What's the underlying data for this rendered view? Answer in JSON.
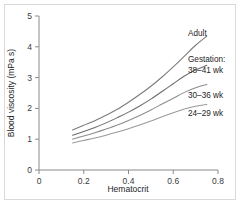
{
  "chart_data": {
    "type": "line",
    "title": "",
    "xlabel": "Hematocrit",
    "ylabel": "Blood viscosity (mPa s)",
    "xlim": [
      0,
      0.8
    ],
    "ylim": [
      0,
      5
    ],
    "xticks": [
      "0",
      "0.2",
      "0.4",
      "0.6",
      "0.8"
    ],
    "xtick_values": [
      0,
      0.2,
      0.4,
      0.6,
      0.8
    ],
    "yticks": [
      "0",
      "1",
      "2",
      "3",
      "4",
      "5"
    ],
    "ytick_values": [
      0,
      1,
      2,
      3,
      4,
      5
    ],
    "grid": false,
    "legend_position": "right-inline-annotations",
    "legend_group_label": "Gestation:",
    "series": [
      {
        "name": "Adult",
        "color": "#7a7a7a",
        "x": [
          0.15,
          0.2,
          0.25,
          0.3,
          0.35,
          0.4,
          0.45,
          0.5,
          0.55,
          0.6,
          0.65,
          0.7,
          0.75
        ],
        "values": [
          1.3,
          1.45,
          1.6,
          1.78,
          1.97,
          2.2,
          2.45,
          2.72,
          3.02,
          3.35,
          3.7,
          4.05,
          4.35
        ]
      },
      {
        "name": "38-41 wk",
        "color": "#6b6b6b",
        "x": [
          0.15,
          0.2,
          0.25,
          0.3,
          0.35,
          0.4,
          0.45,
          0.5,
          0.55,
          0.6,
          0.65,
          0.7,
          0.75
        ],
        "values": [
          1.13,
          1.25,
          1.38,
          1.53,
          1.7,
          1.88,
          2.08,
          2.3,
          2.55,
          2.8,
          3.05,
          3.25,
          3.4
        ]
      },
      {
        "name": "30-36 wk",
        "color": "#8d8d8d",
        "x": [
          0.15,
          0.2,
          0.25,
          0.3,
          0.35,
          0.4,
          0.45,
          0.5,
          0.55,
          0.6,
          0.65,
          0.7,
          0.75
        ],
        "values": [
          1.0,
          1.1,
          1.21,
          1.33,
          1.46,
          1.61,
          1.77,
          1.95,
          2.14,
          2.33,
          2.52,
          2.67,
          2.78
        ]
      },
      {
        "name": "24-29 wk",
        "color": "#9a9a9a",
        "x": [
          0.15,
          0.2,
          0.25,
          0.3,
          0.35,
          0.4,
          0.45,
          0.5,
          0.55,
          0.6,
          0.65,
          0.7,
          0.75
        ],
        "values": [
          0.88,
          0.96,
          1.04,
          1.13,
          1.23,
          1.34,
          1.46,
          1.59,
          1.73,
          1.86,
          1.98,
          2.07,
          2.13
        ]
      }
    ],
    "annotations": [
      {
        "text": "Adult",
        "x_px": 188,
        "y_px": 36
      },
      {
        "text": "Gestation:",
        "x_px": 188,
        "y_px": 62
      },
      {
        "text": "38–41 wk",
        "x_px": 188,
        "y_px": 73
      },
      {
        "text": "30–36 wk",
        "x_px": 188,
        "y_px": 98
      },
      {
        "text": "24–29 wk",
        "x_px": 188,
        "y_px": 116
      }
    ]
  },
  "colors": {
    "background": "#ffffff",
    "frame": "#d9d9d9",
    "axis": "#8a8a8a",
    "text": "#1d1d1d"
  }
}
